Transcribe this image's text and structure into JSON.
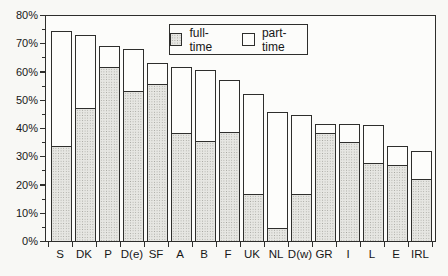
{
  "chart_data": {
    "type": "bar",
    "stacked": true,
    "title": "",
    "xlabel": "",
    "ylabel": "",
    "categories": [
      "S",
      "DK",
      "P",
      "D(e)",
      "SF",
      "A",
      "B",
      "F",
      "UK",
      "NL",
      "D(w)",
      "GR",
      "I",
      "L",
      "E",
      "IRL"
    ],
    "series": [
      {
        "name": "full-time",
        "values": [
          34,
          47.5,
          62,
          53.5,
          56,
          38.5,
          36,
          39,
          17,
          5,
          17,
          38.5,
          35.5,
          28,
          27.5,
          22.5
        ]
      },
      {
        "name": "part-time",
        "values": [
          40.5,
          25.5,
          7,
          14.5,
          7,
          23,
          24.5,
          18,
          35,
          40.5,
          27.5,
          3,
          6,
          13,
          6,
          9.5
        ]
      }
    ],
    "totals": [
      74.5,
      73,
      69,
      68,
      63,
      61.5,
      60.5,
      57,
      52,
      45.5,
      44.5,
      41.5,
      41.5,
      41,
      33.5,
      32
    ],
    "ylim": [
      0,
      80
    ],
    "ytick_labels": [
      "0%",
      "10%",
      "20%",
      "30%",
      "40%",
      "50%",
      "60%",
      "70%",
      "80%"
    ],
    "ytick_step": 10,
    "minor_tick_step": 5,
    "grid": false,
    "legend": {
      "position": "top-center",
      "entries": [
        "full-time",
        "part-time"
      ]
    },
    "colors": {
      "background": "#f8f8f5",
      "plot_bg": "#fcfcfa",
      "line": "#2e2e2c",
      "text": "#171717",
      "fulltime_fill": "#e6e6e2",
      "fulltime_dots": "#a4a49e",
      "parttime_fill": "#fdfdfb"
    }
  }
}
